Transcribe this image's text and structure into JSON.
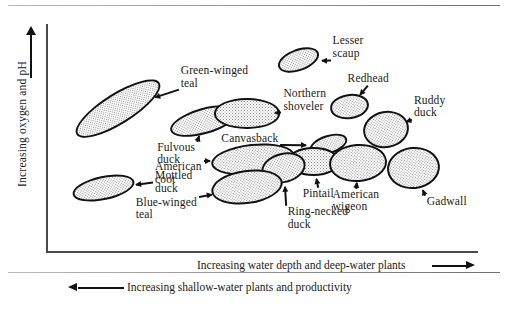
{
  "figure": {
    "y_axis_label": "Increasing oxygen and pH",
    "x_axis_caption_primary": "Increasing water depth and deep-water plants",
    "x_axis_caption_secondary": "Increasing shallow-water plants and productivity"
  },
  "chart_data": {
    "type": "scatter",
    "title": "",
    "xlabel": "Increasing water depth and deep-water plants",
    "ylabel": "Increasing oxygen and pH",
    "secondary_xlabel": "Increasing shallow-water plants and productivity",
    "xlim": [
      0,
      100
    ],
    "ylim": [
      0,
      100
    ],
    "grid": false,
    "legend": "none",
    "note": "Ecological niche diagram: each stippled ellipse is one waterfowl species' habitat envelope.",
    "series": [
      {
        "name": "Green-winged teal",
        "label": "Green-winged\nteal",
        "cx": 16.5,
        "cy": 62.0,
        "rx": 11.5,
        "ry": 6.8,
        "angle": -32,
        "label_x": 31.0,
        "label_y": 79.0,
        "label_align": "left"
      },
      {
        "name": "Mottled duck",
        "label": "Mottled\nduck",
        "cx": 13.0,
        "cy": 27.5,
        "rx": 7.4,
        "ry": 5.2,
        "angle": -12,
        "label_x": 25.0,
        "label_y": 33.0,
        "label_align": "left"
      },
      {
        "name": "Fulvous duck",
        "label": "Fulvous\nduck",
        "cx": 36.5,
        "cy": 57.0,
        "rx": 8.2,
        "ry": 5.6,
        "angle": -16,
        "label_x": 25.5,
        "label_y": 45.5,
        "label_align": "left"
      },
      {
        "name": "Northern shoveler",
        "label": "Northern\nshoveler",
        "cx": 46.5,
        "cy": 60.0,
        "rx": 7.6,
        "ry": 6.6,
        "angle": 0,
        "label_x": 55.0,
        "label_y": 69.0,
        "label_align": "left"
      },
      {
        "name": "Lesser scaup",
        "label": "Lesser\nscaup",
        "cx": 58.5,
        "cy": 83.5,
        "rx": 5.0,
        "ry": 4.8,
        "angle": -20,
        "label_x": 66.5,
        "label_y": 92.0,
        "label_align": "left"
      },
      {
        "name": "Redhead",
        "label": "Redhead",
        "cx": 70.5,
        "cy": 63.0,
        "rx": 4.6,
        "ry": 5.4,
        "angle": -8,
        "label_x": 70.0,
        "label_y": 75.5,
        "label_align": "left"
      },
      {
        "name": "Ruddy duck",
        "label": "Ruddy\nduck",
        "cx": 79.0,
        "cy": 53.0,
        "rx": 5.4,
        "ry": 8.0,
        "angle": -10,
        "label_x": 85.5,
        "label_y": 66.0,
        "label_align": "left"
      },
      {
        "name": "Canvasback",
        "label": "Canvasback",
        "cx": 65.5,
        "cy": 46.5,
        "rx": 4.6,
        "ry": 4.2,
        "angle": -18,
        "label_x": 40.5,
        "label_y": 49.5,
        "label_align": "left"
      },
      {
        "name": "American coot",
        "label": "American\ncoot",
        "cx": 48.0,
        "cy": 40.0,
        "rx": 9.8,
        "ry": 6.8,
        "angle": -6,
        "label_x": 25.0,
        "label_y": 37.0,
        "label_align": "left"
      },
      {
        "name": "Pintail",
        "label": "Pintail",
        "cx": 62.0,
        "cy": 39.0,
        "rx": 6.2,
        "ry": 6.4,
        "angle": 0,
        "label_x": 59.5,
        "label_y": 25.5,
        "label_align": "left"
      },
      {
        "name": "Ring-necked duck",
        "label": "Ring-necked\nduck",
        "cx": 55.0,
        "cy": 36.0,
        "rx": 5.2,
        "ry": 6.6,
        "angle": -14,
        "label_x": 56.0,
        "label_y": 17.5,
        "label_align": "left"
      },
      {
        "name": "Blue-winged teal",
        "label": "Blue-winged\nteal",
        "cx": 46.5,
        "cy": 28.0,
        "rx": 8.4,
        "ry": 7.4,
        "angle": -8,
        "label_x": 20.5,
        "label_y": 21.5,
        "label_align": "left"
      },
      {
        "name": "American wigeon",
        "label": "American\nwigeon",
        "cx": 72.5,
        "cy": 38.5,
        "rx": 6.8,
        "ry": 8.2,
        "angle": -4,
        "label_x": 66.5,
        "label_y": 25.0,
        "label_align": "left"
      },
      {
        "name": "Gadwall",
        "label": "Gadwall",
        "cx": 85.5,
        "cy": 36.0,
        "rx": 6.2,
        "ry": 9.2,
        "angle": -6,
        "label_x": 88.5,
        "label_y": 22.0,
        "label_align": "left"
      }
    ]
  }
}
